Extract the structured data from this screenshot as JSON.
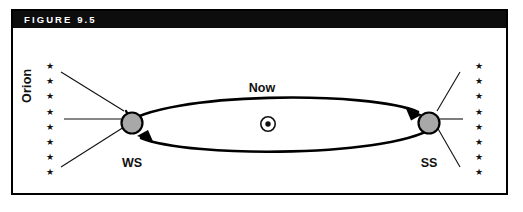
{
  "figure": {
    "title": "FIGURE 9.5",
    "caption_bar_color": "#0d0d0d",
    "frame_color": "#000000",
    "background_color": "#ffffff"
  },
  "diagram": {
    "type": "astronomical-orbit-diagram",
    "constellation_label": "Orion",
    "orbit_label": "Now",
    "sun_symbol": "sun-symbol",
    "planet_fill_color": "#a8a8a8",
    "planet_stroke_color": "#000000",
    "positions": [
      {
        "id": "ws",
        "label": "WS",
        "name": "winter-solstice-position"
      },
      {
        "id": "ss",
        "label": "SS",
        "name": "summer-solstice-position"
      }
    ],
    "star_field": {
      "left_star_count": 8,
      "right_star_count": 8,
      "star_glyph": "★"
    },
    "sight_lines": {
      "left_count": 3,
      "right_count": 3
    },
    "orbit_direction": "clockwise"
  }
}
